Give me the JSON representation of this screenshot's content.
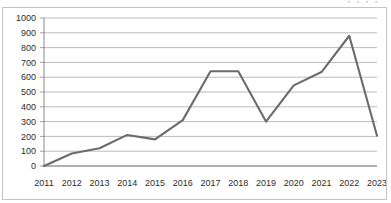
{
  "header": {
    "clipped_text": "・・・・"
  },
  "chart_data": {
    "type": "line",
    "title": "",
    "subtitle": "",
    "xlabel": "",
    "ylabel": "",
    "categories": [
      "2011",
      "2012",
      "2013",
      "2014",
      "2015",
      "2016",
      "2017",
      "2018",
      "2019",
      "2020",
      "2021",
      "2022",
      "2023"
    ],
    "values": [
      0,
      85,
      120,
      210,
      180,
      310,
      640,
      640,
      300,
      545,
      635,
      880,
      205
    ],
    "series": [
      {
        "name": "series-1",
        "color": "#6b6b6b",
        "values": [
          0,
          85,
          120,
          210,
          180,
          310,
          640,
          640,
          300,
          545,
          635,
          880,
          205
        ]
      }
    ],
    "ylim": [
      0,
      1000
    ],
    "ytick_step": 100,
    "yticks": [
      "0",
      "100",
      "200",
      "300",
      "400",
      "500",
      "600",
      "700",
      "800",
      "900",
      "1000"
    ],
    "xticks": [
      "2011",
      "2012",
      "2013",
      "2014",
      "2015",
      "2016",
      "2017",
      "2018",
      "2019",
      "2020",
      "2021",
      "2022",
      "2023"
    ],
    "grid": "horizontal",
    "grid_color": "#9d9d9d",
    "legend": "none",
    "markers": "none",
    "plot_background": "#ffffff",
    "border_color": "#c3c3c3"
  }
}
